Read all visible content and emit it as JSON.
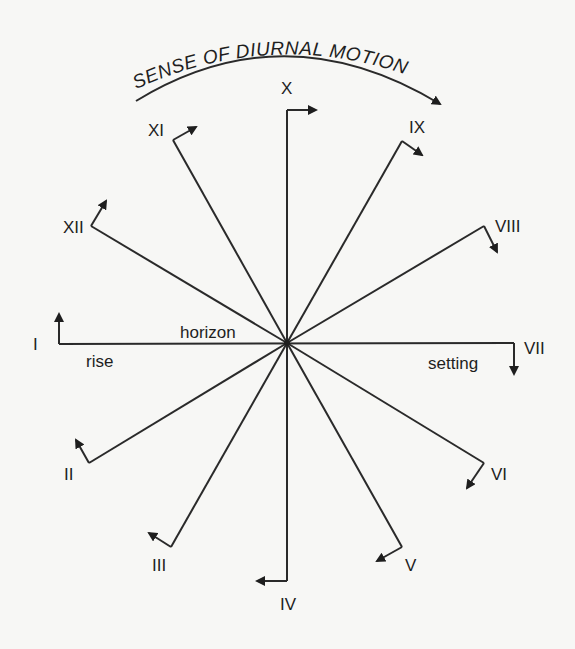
{
  "title": "SENSE OF DIURNAL MOTION",
  "labels": {
    "horizon": "horizon",
    "rise": "rise",
    "setting": "setting"
  },
  "colors": {
    "ink": "#1e1e1e",
    "background": "#f7f7f5"
  },
  "center": {
    "x": 287,
    "y": 343
  },
  "hours": [
    {
      "label": "I",
      "end": [
        59,
        344
      ],
      "tip": [
        59,
        314
      ],
      "text": [
        33,
        350
      ]
    },
    {
      "label": "II",
      "end": [
        89,
        463
      ],
      "tip": [
        76,
        440
      ],
      "text": [
        64,
        480
      ]
    },
    {
      "label": "III",
      "end": [
        171,
        547
      ],
      "tip": [
        149,
        533
      ],
      "text": [
        152,
        571
      ]
    },
    {
      "label": "IV",
      "end": [
        287,
        581
      ],
      "tip": [
        257,
        581
      ],
      "text": [
        280,
        610
      ]
    },
    {
      "label": "V",
      "end": [
        402,
        547
      ],
      "tip": [
        377,
        561
      ],
      "text": [
        405,
        571
      ]
    },
    {
      "label": "VI",
      "end": [
        484,
        463
      ],
      "tip": [
        467,
        488
      ],
      "text": [
        491,
        480
      ]
    },
    {
      "label": "VII",
      "end": [
        514,
        343
      ],
      "tip": [
        514,
        374
      ],
      "text": [
        524,
        354
      ]
    },
    {
      "label": "VIII",
      "end": [
        484,
        226
      ],
      "tip": [
        497,
        252
      ],
      "text": [
        495,
        232
      ]
    },
    {
      "label": "IX",
      "end": [
        402,
        141
      ],
      "tip": [
        422,
        155
      ],
      "text": [
        409,
        133
      ]
    },
    {
      "label": "X",
      "end": [
        287,
        110
      ],
      "tip": [
        316,
        110
      ],
      "text": [
        281,
        94
      ]
    },
    {
      "label": "XI",
      "end": [
        173,
        140
      ],
      "tip": [
        196,
        127
      ],
      "text": [
        148,
        136
      ]
    },
    {
      "label": "XII",
      "end": [
        91,
        226
      ],
      "tip": [
        106,
        201
      ],
      "text": [
        63,
        233
      ]
    }
  ]
}
